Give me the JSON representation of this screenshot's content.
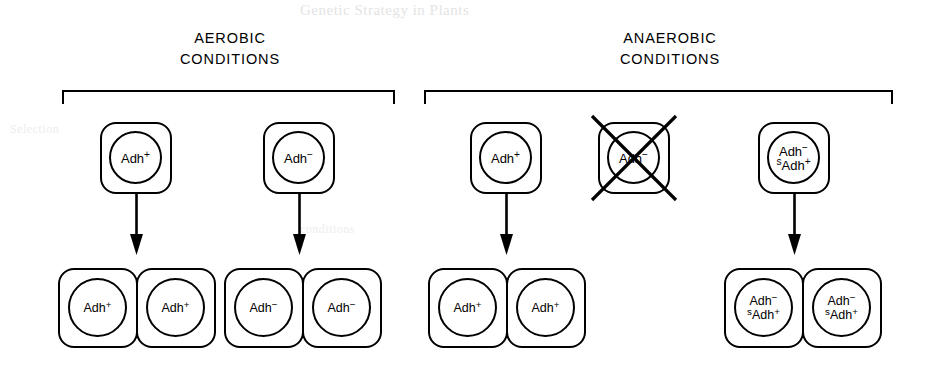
{
  "figure": {
    "width": 934,
    "height": 371,
    "background": "#ffffff",
    "ink_color": "#000000"
  },
  "bleed_through": {
    "title": "Genetic Strategy in Plants",
    "left": "Selection",
    "mid": "conditions"
  },
  "groups": [
    {
      "id": "aerobic",
      "heading_line1": "AEROBIC",
      "heading_line2": "CONDITIONS",
      "bracket": {
        "left": 62,
        "top": 90,
        "width": 333
      }
    },
    {
      "id": "anaerobic",
      "heading_line1": "ANAEROBIC",
      "heading_line2": "CONDITIONS",
      "bracket": {
        "left": 424,
        "top": 90,
        "width": 469
      }
    }
  ],
  "lineages": [
    {
      "id": "aerobic-adh-plus",
      "group": "aerobic",
      "parent": {
        "genotype_lines": [
          {
            "pre_sup": "",
            "base": "Adh",
            "sup": "+"
          }
        ],
        "killed": false,
        "x": 100,
        "y": 122
      },
      "arrow": {
        "x": 136,
        "y": 196,
        "length": 60,
        "survives": true
      },
      "daughters": {
        "count": 2,
        "genotype_lines": [
          {
            "pre_sup": "",
            "base": "Adh",
            "sup": "+"
          }
        ],
        "x": 58,
        "y": 268
      }
    },
    {
      "id": "aerobic-adh-minus",
      "group": "aerobic",
      "parent": {
        "genotype_lines": [
          {
            "pre_sup": "",
            "base": "Adh",
            "sup": "−"
          }
        ],
        "killed": false,
        "x": 263,
        "y": 122
      },
      "arrow": {
        "x": 299,
        "y": 196,
        "length": 60,
        "survives": true
      },
      "daughters": {
        "count": 2,
        "genotype_lines": [
          {
            "pre_sup": "",
            "base": "Adh",
            "sup": "−"
          }
        ],
        "x": 224,
        "y": 268
      }
    },
    {
      "id": "anaerobic-adh-plus",
      "group": "anaerobic",
      "parent": {
        "genotype_lines": [
          {
            "pre_sup": "",
            "base": "Adh",
            "sup": "+"
          }
        ],
        "killed": false,
        "x": 470,
        "y": 122
      },
      "arrow": {
        "x": 506,
        "y": 196,
        "length": 60,
        "survives": true
      },
      "daughters": {
        "count": 2,
        "genotype_lines": [
          {
            "pre_sup": "",
            "base": "Adh",
            "sup": "+"
          }
        ],
        "x": 428,
        "y": 268
      }
    },
    {
      "id": "anaerobic-adh-minus-killed",
      "group": "anaerobic",
      "parent": {
        "genotype_lines": [
          {
            "pre_sup": "",
            "base": "Adh",
            "sup": "−"
          }
        ],
        "killed": true,
        "x": 598,
        "y": 122
      },
      "arrow": null,
      "daughters": null
    },
    {
      "id": "anaerobic-merodiploid",
      "group": "anaerobic",
      "parent": {
        "genotype_lines": [
          {
            "pre_sup": "",
            "base": "Adh",
            "sup": "−"
          },
          {
            "pre_sup": "s",
            "base": "Adh",
            "sup": "+"
          }
        ],
        "killed": false,
        "x": 758,
        "y": 122
      },
      "arrow": {
        "x": 794,
        "y": 196,
        "length": 60,
        "survives": true
      },
      "daughters": {
        "count": 2,
        "genotype_lines": [
          {
            "pre_sup": "",
            "base": "Adh",
            "sup": "−"
          },
          {
            "pre_sup": "s",
            "base": "Adh",
            "sup": "+"
          }
        ],
        "x": 724,
        "y": 268
      }
    }
  ]
}
